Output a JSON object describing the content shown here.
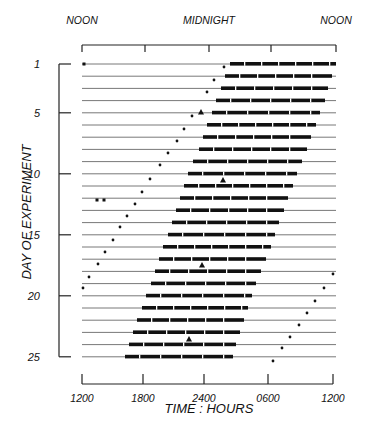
{
  "chart_data": {
    "type": "actogram",
    "title": "",
    "top_labels": [
      {
        "text": "NOON",
        "x": 82
      },
      {
        "text": "MIDNIGHT",
        "x": 209
      },
      {
        "text": "NOON",
        "x": 336
      }
    ],
    "xlabel": "TIME : HOURS",
    "ylabel": "DAY OF EXPERIMENT",
    "x_ticks": [
      "1200",
      "1800",
      "2400",
      "0600",
      "1200"
    ],
    "x_range_hours": [
      12,
      36
    ],
    "y_ticks": [
      1,
      5,
      10,
      15,
      20,
      25
    ],
    "y_range": [
      1,
      25
    ],
    "grid": false,
    "legend": "none",
    "activity_bars": [
      {
        "day": 1,
        "start": "02:30",
        "end": "12:00"
      },
      {
        "day": 2,
        "start": "02:10",
        "end": "11:40"
      },
      {
        "day": 3,
        "start": "01:50",
        "end": "11:20"
      },
      {
        "day": 4,
        "start": "01:25",
        "end": "11:05"
      },
      {
        "day": 5,
        "start": "01:00",
        "end": "10:40"
      },
      {
        "day": 6,
        "start": "00:40",
        "end": "10:20"
      },
      {
        "day": 7,
        "start": "00:20",
        "end": "09:55"
      },
      {
        "day": 8,
        "start": "00:00",
        "end": "09:35"
      },
      {
        "day": 9,
        "start": "23:35",
        "end": "09:10"
      },
      {
        "day": 10,
        "start": "23:10",
        "end": "08:45"
      },
      {
        "day": 11,
        "start": "22:50",
        "end": "08:25"
      },
      {
        "day": 12,
        "start": "22:30",
        "end": "08:10"
      },
      {
        "day": 13,
        "start": "22:10",
        "end": "07:50"
      },
      {
        "day": 14,
        "start": "21:50",
        "end": "07:25"
      },
      {
        "day": 15,
        "start": "21:30",
        "end": "07:05"
      },
      {
        "day": 16,
        "start": "21:05",
        "end": "06:50"
      },
      {
        "day": 17,
        "start": "20:45",
        "end": "06:25"
      },
      {
        "day": 18,
        "start": "20:25",
        "end": "06:05"
      },
      {
        "day": 19,
        "start": "20:10",
        "end": "05:40"
      },
      {
        "day": 20,
        "start": "19:50",
        "end": "05:20"
      },
      {
        "day": 21,
        "start": "19:30",
        "end": "05:00"
      },
      {
        "day": 22,
        "start": "19:05",
        "end": "04:40"
      },
      {
        "day": 23,
        "start": "18:45",
        "end": "04:20"
      },
      {
        "day": 24,
        "start": "18:25",
        "end": "04:00"
      },
      {
        "day": 25,
        "start": "18:05",
        "end": "03:45"
      }
    ],
    "phase_markers": {
      "description": "Dots showing drifting phase marker, one per day",
      "left_diagonal_days": [
        1,
        2,
        3,
        4,
        5,
        6,
        7,
        8,
        9,
        10,
        11,
        12,
        13,
        14,
        15,
        16,
        17,
        18,
        19
      ],
      "right_diagonal_days": [
        18,
        19,
        20,
        21,
        22,
        23,
        24,
        25
      ]
    },
    "triangle_markers": [
      {
        "day": 4,
        "time": "23:45"
      },
      {
        "day": 10,
        "time": "02:00"
      },
      {
        "day": 17,
        "time": "23:40"
      },
      {
        "day": 23,
        "time": "22:30"
      }
    ]
  },
  "geometry": {
    "plot_left": 82,
    "plot_right": 336,
    "row_first_y": 64,
    "row_spacing": 12.2,
    "bars_px": [
      [
        230,
        336
      ],
      [
        225,
        332
      ],
      [
        221,
        328
      ],
      [
        216,
        325
      ],
      [
        212,
        320
      ],
      [
        207,
        316
      ],
      [
        203,
        311
      ],
      [
        199,
        307
      ],
      [
        193,
        302
      ],
      [
        188,
        297
      ],
      [
        184,
        293
      ],
      [
        180,
        288
      ],
      [
        176,
        284
      ],
      [
        172,
        279
      ],
      [
        168,
        275
      ],
      [
        163,
        271
      ],
      [
        159,
        266
      ],
      [
        155,
        261
      ],
      [
        151,
        256
      ],
      [
        146,
        252
      ],
      [
        142,
        248
      ],
      [
        137,
        244
      ],
      [
        133,
        240
      ],
      [
        129,
        236
      ],
      [
        125,
        233
      ]
    ],
    "dots_px": [
      [
        224,
        67
      ],
      [
        214,
        80
      ],
      [
        207,
        92
      ],
      [
        192,
        116
      ],
      [
        184,
        129
      ],
      [
        177,
        141
      ],
      [
        168,
        153
      ],
      [
        160,
        165
      ],
      [
        150,
        179
      ],
      [
        142,
        192
      ],
      [
        135,
        204
      ],
      [
        127,
        216
      ],
      [
        120,
        227
      ],
      [
        113,
        240
      ],
      [
        105,
        252
      ],
      [
        98,
        264
      ],
      [
        89,
        277
      ],
      [
        83,
        288
      ],
      [
        333,
        274
      ],
      [
        324,
        288
      ],
      [
        315,
        301
      ],
      [
        307,
        313
      ],
      [
        299,
        325
      ],
      [
        290,
        337
      ],
      [
        282,
        348
      ],
      [
        273,
        361
      ]
    ],
    "triangles_px": [
      [
        201,
        112
      ],
      [
        223,
        180
      ],
      [
        202,
        265
      ],
      [
        189,
        339
      ]
    ],
    "small_marks_px": [
      [
        84,
        64
      ],
      [
        97,
        200
      ],
      [
        104,
        200
      ]
    ]
  }
}
